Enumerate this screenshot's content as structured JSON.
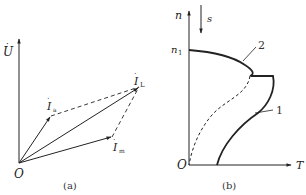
{
  "figure_a": {
    "caption": "(a)",
    "origin_label": "O",
    "voltage_label": "U",
    "phasors": [
      {
        "id": "I_a",
        "label": "I",
        "subscript": "a",
        "tip": [
          51,
          116
        ]
      },
      {
        "id": "I_L",
        "label": "I",
        "subscript": "L",
        "tip": [
          139,
          87
        ]
      },
      {
        "id": "I_m",
        "label": "I",
        "subscript": "m",
        "tip": [
          112,
          137
        ]
      }
    ]
  },
  "figure_b": {
    "caption": "(b)",
    "origin_label": "O",
    "y_axis_label": "n",
    "x_axis_label": "T",
    "n1_label": "n",
    "n1_subscript": "1",
    "slip_label": "s",
    "curve_labels": {
      "curve1": "1",
      "curve2": "2"
    }
  },
  "colors": {
    "line": "#222222",
    "background": "#ffffff"
  }
}
